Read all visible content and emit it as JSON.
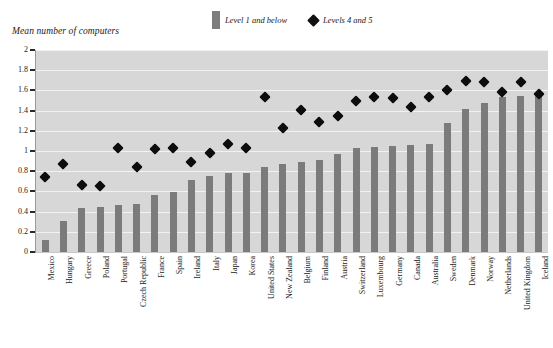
{
  "chart_data": {
    "type": "bar",
    "title": "",
    "subtitle": "",
    "ylabel": "Mean number of computers",
    "xlabel": "",
    "ylim": [
      0,
      2
    ],
    "ytick_values": [
      0,
      0.2,
      0.4,
      0.6,
      0.8,
      1,
      1.2,
      1.4,
      1.6,
      1.8,
      2
    ],
    "ytick_labels": [
      "0",
      "0.2",
      "0.4",
      "0.6",
      "0.8",
      "1",
      "1.2",
      "1.4",
      "1.6",
      "1.8",
      "2"
    ],
    "grid": true,
    "legend_position": "top-center",
    "categories": [
      "Mexico",
      "Hungary",
      "Greece",
      "Poland",
      "Portugal",
      "Czech Republic",
      "France",
      "Spain",
      "Ireland",
      "Italy",
      "Japan",
      "Korea",
      "United States",
      "New Zealand",
      "Belgium",
      "Finland",
      "Austria",
      "Switzerland",
      "Luxembourg",
      "Germany",
      "Canada",
      "Australia",
      "Sweden",
      "Denmark",
      "Norway",
      "Netherlands",
      "United Kingdom",
      "Iceland"
    ],
    "series": [
      {
        "name": "Level 1 and below",
        "marker": "bar",
        "color": "#7b7b7b",
        "values": [
          0.12,
          0.31,
          0.44,
          0.45,
          0.47,
          0.48,
          0.56,
          0.59,
          0.71,
          0.75,
          0.78,
          0.78,
          0.84,
          0.87,
          0.89,
          0.91,
          0.97,
          1.03,
          1.04,
          1.05,
          1.06,
          1.07,
          1.28,
          1.42,
          1.48,
          1.53,
          1.54,
          1.55
        ]
      },
      {
        "name": "Levels 4 and 5",
        "marker": "diamond",
        "color": "#0d0d0d",
        "values": [
          0.78,
          0.91,
          0.7,
          0.69,
          1.07,
          0.88,
          1.06,
          1.07,
          0.93,
          1.02,
          1.11,
          1.07,
          1.57,
          1.27,
          1.45,
          1.33,
          1.39,
          1.53,
          1.57,
          1.56,
          1.48,
          1.57,
          1.64,
          1.73,
          1.72,
          1.62,
          1.72,
          1.6
        ]
      }
    ]
  },
  "legend": {
    "items": [
      {
        "label": "Level 1 and below",
        "marker": "bar"
      },
      {
        "label": "Levels 4 and 5",
        "marker": "diamond"
      }
    ]
  },
  "colors": {
    "plot_background": "#d7d7d7",
    "bar": "#7b7b7b",
    "diamond": "#0d0d0d",
    "gridline": "#f2f2f2",
    "page_background": "#ffffff",
    "text": "#1a1a1a"
  }
}
